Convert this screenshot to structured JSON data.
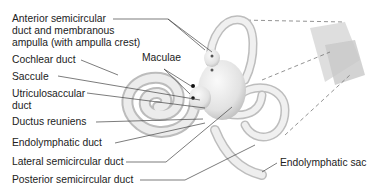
{
  "diagram": {
    "labels": {
      "anterior_1": "Anterior semicircular",
      "anterior_2": "duct and membranous",
      "anterior_3": "ampulla (with ampulla crest)",
      "cochlear": "Cochlear duct",
      "maculae": "Maculae",
      "saccule": "Saccule",
      "utriculo_1": "Utriculosaccular",
      "utriculo_2": "duct",
      "reuniens": "Ductus reuniens",
      "endo_duct": "Endolymphatic duct",
      "lateral": "Lateral semicircular duct",
      "posterior": "Posterior semicircular duct",
      "endo_sac": "Endolymphatic sac"
    }
  }
}
